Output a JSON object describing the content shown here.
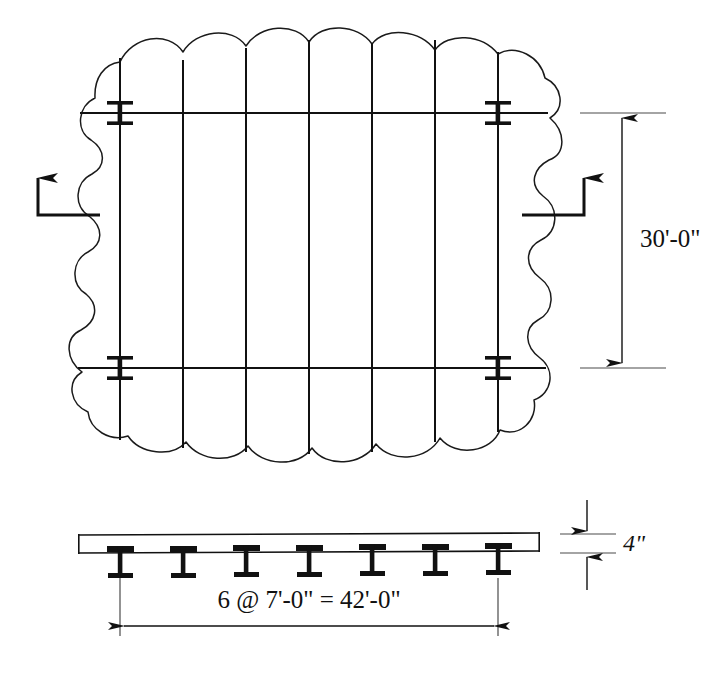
{
  "drawing": {
    "type": "structural-framing-drawing",
    "views": [
      {
        "id": "plan",
        "name": "framing-plan-view"
      },
      {
        "id": "section",
        "name": "slab-section-view"
      }
    ]
  },
  "annotations": {
    "bay_width_label": "30'-0\"",
    "spacing_label": "6 @ 7'-0\" = 42'-0\"",
    "slab_thickness_label": "4\""
  },
  "plan": {
    "joist_count": 7,
    "joist_spacing_px": 63,
    "joist_x": [
      120,
      183,
      246,
      309,
      372,
      435,
      498
    ],
    "joist_top_y": 45,
    "joist_bottom_y": 452,
    "girder_y": [
      113,
      368
    ],
    "girder_x_start": 78,
    "girder_x_end": 548,
    "column_positions": [
      {
        "x": 120,
        "y": 113
      },
      {
        "x": 498,
        "y": 113
      },
      {
        "x": 120,
        "y": 368
      },
      {
        "x": 498,
        "y": 368
      }
    ],
    "break_boundary": "scalloped-cloud-line"
  },
  "section": {
    "beam_count": 7,
    "beam_x": [
      120,
      183,
      246,
      309,
      372,
      435,
      498
    ],
    "slab_top_y": 535,
    "slab_bottom_y": 553,
    "slab_left_x": 78,
    "slab_right_x": 540,
    "beam_depth_px": 30
  },
  "dimensions": {
    "vertical": {
      "label": "30'-0\"",
      "x": 622,
      "top_y": 113,
      "bottom_y": 368,
      "ext_left_x": 580,
      "ext_right_x": 665,
      "text_x": 640,
      "text_y": 240,
      "arrows": "both-ends-outward"
    },
    "horizontal": {
      "label": "6 @ 7'-0\" = 42'-0\"",
      "y": 626,
      "left_x": 120,
      "right_x": 498,
      "ext_top_y": 578,
      "text_x": 309,
      "text_y": 602,
      "arrows": "both-ends-outward"
    },
    "thickness": {
      "label": "4\"",
      "x": 587,
      "top_y": 535,
      "bottom_y": 553,
      "ext_left_x": 560,
      "ext_right_x": 614,
      "text_x": 625,
      "text_y": 545,
      "arrows": "both-ends-inward"
    }
  },
  "section_markers": [
    {
      "id": "left",
      "name": "section-cut-left",
      "direction": "up",
      "tail": "right",
      "arrow_x": 38,
      "corner_x": 38,
      "corner_y": 215,
      "tail_end_x": 100,
      "arrow_tip_y": 168
    },
    {
      "id": "right",
      "name": "section-cut-right",
      "direction": "up",
      "tail": "left",
      "arrow_x": 584,
      "corner_x": 584,
      "corner_y": 215,
      "tail_end_x": 522,
      "arrow_tip_y": 168
    }
  ],
  "colors": {
    "ink": "#111111",
    "background": "#ffffff",
    "extension_line": "#4a4a4a"
  }
}
